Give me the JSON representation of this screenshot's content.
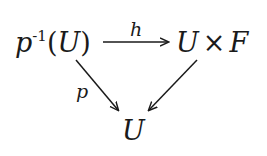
{
  "diagram": {
    "type": "commutative-diagram",
    "nodes": {
      "top_left": {
        "base": "p",
        "superscript": "-1",
        "paren_open": "(",
        "arg": "U",
        "paren_close": ")"
      },
      "top_right": {
        "left": "U",
        "op": "×",
        "right": "F"
      },
      "bottom": {
        "text": "U"
      }
    },
    "arrows": {
      "top": {
        "label": "h",
        "from": "p^-1(U)",
        "to": "U × F"
      },
      "left_diagonal": {
        "label": "p",
        "from": "p^-1(U)",
        "to": "U"
      },
      "right_diagonal": {
        "label": "",
        "from": "U × F",
        "to": "U"
      }
    },
    "colors": {
      "ink": "#1a1a1a",
      "background": "#ffffff"
    }
  }
}
